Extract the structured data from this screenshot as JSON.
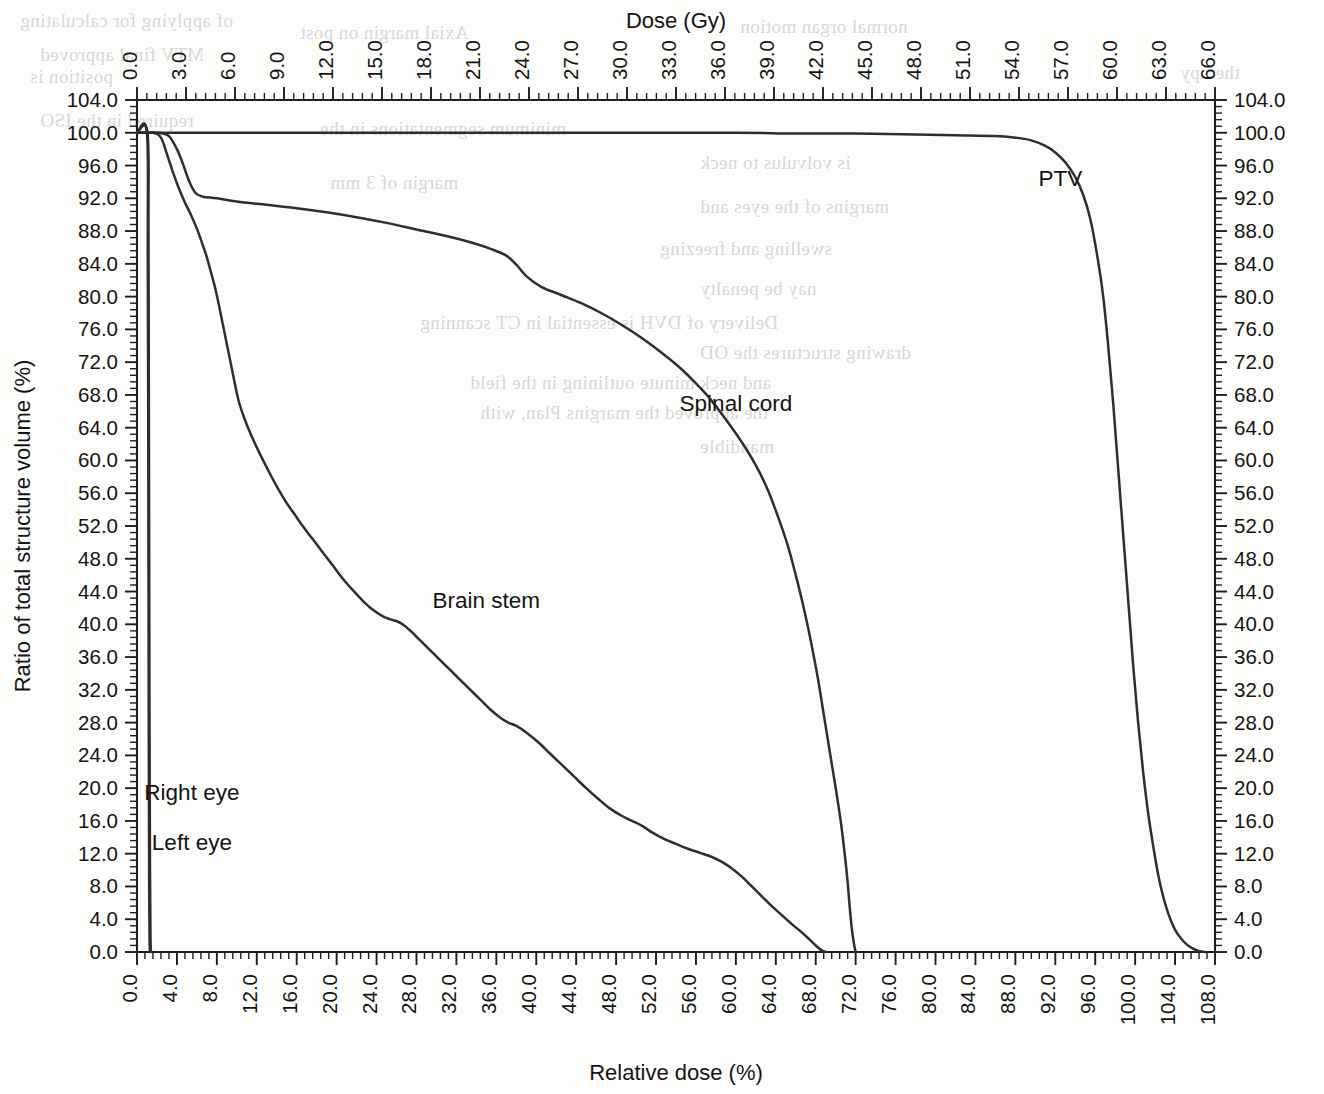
{
  "chart_data": {
    "type": "line",
    "title": "",
    "subtitle": "",
    "xlabel": "Relative dose (%)",
    "ylabel": "Ratio of total structure volume (%)",
    "top_axis_label": "Dose (Gy)",
    "right_axis_label": "",
    "xlim": [
      0,
      108
    ],
    "ylim": [
      0,
      104
    ],
    "top_xlim": [
      0,
      66
    ],
    "grid": false,
    "legend_position": "inline-annotations",
    "xticks": [
      0.0,
      4.0,
      8.0,
      12.0,
      16.0,
      20.0,
      24.0,
      28.0,
      32.0,
      36.0,
      40.0,
      44.0,
      48.0,
      52.0,
      56.0,
      60.0,
      64.0,
      68.0,
      72.0,
      76.0,
      80.0,
      84.0,
      88.0,
      92.0,
      96.0,
      100.0,
      104.0,
      108.0
    ],
    "xticklabels": [
      "0.0",
      "4.0",
      "8.0",
      "12.0",
      "16.0",
      "20.0",
      "24.0",
      "28.0",
      "32.0",
      "36.0",
      "40.0",
      "44.0",
      "48.0",
      "52.0",
      "56.0",
      "60.0",
      "64.0",
      "68.0",
      "72.0",
      "76.0",
      "80.0",
      "84.0",
      "88.0",
      "92.0",
      "96.0",
      "100.0",
      "104.0",
      "108.0"
    ],
    "top_xticks": [
      0.0,
      3.0,
      6.0,
      9.0,
      12.0,
      15.0,
      18.0,
      21.0,
      24.0,
      27.0,
      30.0,
      33.0,
      36.0,
      39.0,
      42.0,
      45.0,
      48.0,
      51.0,
      54.0,
      57.0,
      60.0,
      63.0,
      66.0
    ],
    "top_xticklabels": [
      "0.0",
      "3.0",
      "6.0",
      "9.0",
      "12.0",
      "15.0",
      "18.0",
      "21.0",
      "24.0",
      "27.0",
      "30.0",
      "33.0",
      "36.0",
      "39.0",
      "42.0",
      "45.0",
      "48.0",
      "51.0",
      "54.0",
      "57.0",
      "60.0",
      "63.0",
      "66.0"
    ],
    "yticks": [
      0.0,
      4.0,
      8.0,
      12.0,
      16.0,
      20.0,
      24.0,
      28.0,
      32.0,
      36.0,
      40.0,
      44.0,
      48.0,
      52.0,
      56.0,
      60.0,
      64.0,
      68.0,
      72.0,
      76.0,
      80.0,
      84.0,
      88.0,
      92.0,
      96.0,
      100.0,
      104.0
    ],
    "yticklabels": [
      "0.0",
      "4.0",
      "8.0",
      "12.0",
      "16.0",
      "20.0",
      "24.0",
      "28.0",
      "32.0",
      "36.0",
      "40.0",
      "44.0",
      "48.0",
      "52.0",
      "56.0",
      "60.0",
      "64.0",
      "68.0",
      "72.0",
      "76.0",
      "80.0",
      "84.0",
      "88.0",
      "92.0",
      "96.0",
      "100.0",
      "104.0"
    ],
    "minor_ticks_per_major": 4,
    "line_color": "#2e2e2e",
    "series": [
      {
        "name": "PTV",
        "label": "PTV",
        "label_x": 92.5,
        "label_y": 93.5,
        "points": [
          [
            0.0,
            100.0
          ],
          [
            2.0,
            100.0
          ],
          [
            10.0,
            100.0
          ],
          [
            20.0,
            100.0
          ],
          [
            30.0,
            100.0
          ],
          [
            40.0,
            100.0
          ],
          [
            50.0,
            100.0
          ],
          [
            60.0,
            100.0
          ],
          [
            66.0,
            99.9
          ],
          [
            72.0,
            99.9
          ],
          [
            78.0,
            99.8
          ],
          [
            82.0,
            99.7
          ],
          [
            86.0,
            99.6
          ],
          [
            88.0,
            99.4
          ],
          [
            89.5,
            99.1
          ],
          [
            91.0,
            98.4
          ],
          [
            92.0,
            97.6
          ],
          [
            93.0,
            96.4
          ],
          [
            94.0,
            94.6
          ],
          [
            94.8,
            92.4
          ],
          [
            95.5,
            89.5
          ],
          [
            96.2,
            85.0
          ],
          [
            96.8,
            80.0
          ],
          [
            97.3,
            74.0
          ],
          [
            97.8,
            67.0
          ],
          [
            98.3,
            59.0
          ],
          [
            98.8,
            51.0
          ],
          [
            99.3,
            43.0
          ],
          [
            99.8,
            35.0
          ],
          [
            100.3,
            28.0
          ],
          [
            100.8,
            22.0
          ],
          [
            101.3,
            17.0
          ],
          [
            101.8,
            13.0
          ],
          [
            102.3,
            9.5
          ],
          [
            102.8,
            6.8
          ],
          [
            103.4,
            4.4
          ],
          [
            104.0,
            2.7
          ],
          [
            104.7,
            1.5
          ],
          [
            105.4,
            0.7
          ],
          [
            106.2,
            0.2
          ],
          [
            107.0,
            0.0
          ]
        ]
      },
      {
        "name": "Spinal cord",
        "label": "Spinal cord",
        "label_x": 60.0,
        "label_y": 66.0,
        "points": [
          [
            0.0,
            100.0
          ],
          [
            2.2,
            100.0
          ],
          [
            3.2,
            99.6
          ],
          [
            4.0,
            98.0
          ],
          [
            4.6,
            96.2
          ],
          [
            5.0,
            94.8
          ],
          [
            5.4,
            93.6
          ],
          [
            5.9,
            92.6
          ],
          [
            6.6,
            92.2
          ],
          [
            8.0,
            92.0
          ],
          [
            10.0,
            91.6
          ],
          [
            13.0,
            91.2
          ],
          [
            16.0,
            90.8
          ],
          [
            19.0,
            90.3
          ],
          [
            22.0,
            89.7
          ],
          [
            25.0,
            89.0
          ],
          [
            28.0,
            88.2
          ],
          [
            31.0,
            87.4
          ],
          [
            33.5,
            86.6
          ],
          [
            35.5,
            85.8
          ],
          [
            37.0,
            85.0
          ],
          [
            38.0,
            83.9
          ],
          [
            39.0,
            82.5
          ],
          [
            40.5,
            81.2
          ],
          [
            42.5,
            80.2
          ],
          [
            44.5,
            79.2
          ],
          [
            46.5,
            78.0
          ],
          [
            48.5,
            76.6
          ],
          [
            50.5,
            75.0
          ],
          [
            52.5,
            73.2
          ],
          [
            54.5,
            71.2
          ],
          [
            56.0,
            69.4
          ],
          [
            57.5,
            67.4
          ],
          [
            59.0,
            65.0
          ],
          [
            60.5,
            62.4
          ],
          [
            62.0,
            59.4
          ],
          [
            63.2,
            56.4
          ],
          [
            64.2,
            53.2
          ],
          [
            65.2,
            49.6
          ],
          [
            66.0,
            46.0
          ],
          [
            66.8,
            42.0
          ],
          [
            67.5,
            38.0
          ],
          [
            68.2,
            33.5
          ],
          [
            68.8,
            29.0
          ],
          [
            69.4,
            24.5
          ],
          [
            70.0,
            20.0
          ],
          [
            70.5,
            16.0
          ],
          [
            70.9,
            12.0
          ],
          [
            71.2,
            8.5
          ],
          [
            71.4,
            5.5
          ],
          [
            71.6,
            3.0
          ],
          [
            71.8,
            1.2
          ],
          [
            72.0,
            0.0
          ]
        ]
      },
      {
        "name": "Brain stem",
        "label": "Brain stem",
        "label_x": 35.0,
        "label_y": 42.0,
        "points": [
          [
            0.0,
            100.0
          ],
          [
            1.6,
            100.0
          ],
          [
            2.4,
            99.4
          ],
          [
            3.0,
            97.4
          ],
          [
            3.6,
            95.2
          ],
          [
            4.2,
            93.2
          ],
          [
            4.8,
            91.5
          ],
          [
            5.4,
            90.0
          ],
          [
            6.0,
            88.3
          ],
          [
            6.5,
            86.6
          ],
          [
            7.0,
            84.8
          ],
          [
            7.4,
            83.0
          ],
          [
            7.8,
            81.2
          ],
          [
            8.2,
            79.0
          ],
          [
            8.6,
            76.6
          ],
          [
            9.0,
            74.2
          ],
          [
            9.4,
            71.8
          ],
          [
            9.8,
            69.4
          ],
          [
            10.2,
            67.2
          ],
          [
            10.8,
            65.0
          ],
          [
            11.4,
            63.2
          ],
          [
            12.0,
            61.6
          ],
          [
            12.6,
            60.1
          ],
          [
            13.4,
            58.2
          ],
          [
            14.2,
            56.4
          ],
          [
            15.0,
            54.8
          ],
          [
            15.8,
            53.4
          ],
          [
            16.6,
            52.0
          ],
          [
            17.6,
            50.4
          ],
          [
            18.6,
            48.8
          ],
          [
            19.6,
            47.2
          ],
          [
            20.6,
            45.6
          ],
          [
            21.6,
            44.2
          ],
          [
            22.6,
            42.9
          ],
          [
            23.6,
            41.8
          ],
          [
            24.6,
            41.0
          ],
          [
            25.4,
            40.6
          ],
          [
            26.0,
            40.4
          ],
          [
            26.6,
            40.0
          ],
          [
            27.4,
            39.2
          ],
          [
            28.4,
            38.0
          ],
          [
            29.4,
            36.8
          ],
          [
            30.4,
            35.6
          ],
          [
            31.4,
            34.4
          ],
          [
            32.4,
            33.2
          ],
          [
            33.4,
            32.0
          ],
          [
            34.4,
            30.8
          ],
          [
            35.4,
            29.6
          ],
          [
            36.4,
            28.6
          ],
          [
            37.2,
            28.0
          ],
          [
            38.0,
            27.6
          ],
          [
            39.0,
            26.8
          ],
          [
            40.2,
            25.6
          ],
          [
            41.4,
            24.2
          ],
          [
            42.6,
            22.8
          ],
          [
            43.8,
            21.4
          ],
          [
            45.0,
            20.0
          ],
          [
            46.2,
            18.7
          ],
          [
            47.4,
            17.5
          ],
          [
            48.6,
            16.6
          ],
          [
            49.6,
            16.0
          ],
          [
            50.6,
            15.4
          ],
          [
            51.6,
            14.6
          ],
          [
            52.8,
            13.8
          ],
          [
            54.0,
            13.2
          ],
          [
            55.2,
            12.6
          ],
          [
            56.4,
            12.1
          ],
          [
            57.6,
            11.6
          ],
          [
            58.6,
            11.0
          ],
          [
            59.6,
            10.2
          ],
          [
            60.6,
            9.2
          ],
          [
            61.6,
            8.0
          ],
          [
            62.6,
            6.8
          ],
          [
            63.6,
            5.6
          ],
          [
            64.6,
            4.5
          ],
          [
            65.6,
            3.4
          ],
          [
            66.6,
            2.4
          ],
          [
            67.4,
            1.5
          ],
          [
            68.0,
            0.8
          ],
          [
            68.6,
            0.2
          ],
          [
            69.0,
            0.0
          ]
        ]
      },
      {
        "name": "Right eye",
        "label": "Right eye",
        "label_x": 5.5,
        "label_y": 18.5,
        "points": [
          [
            0.0,
            100.0
          ],
          [
            1.05,
            100.0
          ],
          [
            1.15,
            88.0
          ],
          [
            1.2,
            60.0
          ],
          [
            1.25,
            30.0
          ],
          [
            1.3,
            10.0
          ],
          [
            1.35,
            2.0
          ],
          [
            1.4,
            0.0
          ]
        ]
      },
      {
        "name": "Left eye",
        "label": "Left eye",
        "label_x": 5.5,
        "label_y": 12.5,
        "points": [
          [
            0.0,
            100.0
          ],
          [
            1.0,
            100.0
          ],
          [
            1.08,
            85.0
          ],
          [
            1.14,
            55.0
          ],
          [
            1.18,
            25.0
          ],
          [
            1.22,
            8.0
          ],
          [
            1.26,
            1.5
          ],
          [
            1.3,
            0.0
          ]
        ]
      }
    ]
  },
  "bleed_text": {
    "lines": [
      {
        "text": "Axial margin on post",
        "x": 300,
        "y": 22
      },
      {
        "text": "normal organ motion",
        "x": 740,
        "y": 16
      },
      {
        "text": "MTV final approved",
        "x": 40,
        "y": 44
      },
      {
        "text": "of applying for calculating",
        "x": 20,
        "y": 10
      },
      {
        "text": "position is",
        "x": 30,
        "y": 66
      },
      {
        "text": "therapy",
        "x": 1180,
        "y": 62
      },
      {
        "text": "minimum segmentations in the",
        "x": 320,
        "y": 118
      },
      {
        "text": "required in the ISO",
        "x": 40,
        "y": 110
      },
      {
        "text": "is volvulus to neck",
        "x": 700,
        "y": 152
      },
      {
        "text": "margin of 3 mm",
        "x": 330,
        "y": 172
      },
      {
        "text": "margins of the eyes and",
        "x": 700,
        "y": 196
      },
      {
        "text": "swelling and freezing",
        "x": 660,
        "y": 238
      },
      {
        "text": "nay be penalty",
        "x": 700,
        "y": 278
      },
      {
        "text": "Delivery of DVH is essential in CT scanning",
        "x": 420,
        "y": 312
      },
      {
        "text": "drawing structures the OD",
        "x": 700,
        "y": 342
      },
      {
        "text": "and neck minute outlining in the field",
        "x": 470,
        "y": 372
      },
      {
        "text": "the approved the margins Plan, with",
        "x": 480,
        "y": 402
      },
      {
        "text": "mandible",
        "x": 700,
        "y": 436
      }
    ]
  }
}
